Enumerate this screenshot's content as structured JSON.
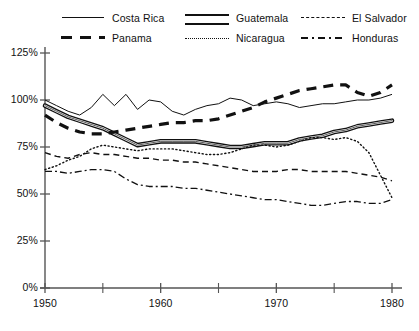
{
  "chart_data": {
    "type": "line",
    "title": "",
    "subtitle": "",
    "xlabel": "",
    "ylabel": "",
    "xlim": [
      1950,
      1980
    ],
    "ylim": [
      0,
      125
    ],
    "grid": false,
    "legend_position": "top",
    "y_ticks": [
      "0%",
      "25%",
      "50%",
      "75%",
      "100%",
      "125%"
    ],
    "y_tick_values": [
      0,
      25,
      50,
      75,
      100,
      125
    ],
    "x_ticks": [
      "1950",
      "1960",
      "1970",
      "1980"
    ],
    "x_tick_values": [
      1950,
      1960,
      1970,
      1980
    ],
    "x_minor_tick_values": [
      1955,
      1965,
      1975
    ],
    "x": [
      1950,
      1951,
      1952,
      1953,
      1954,
      1955,
      1956,
      1957,
      1958,
      1959,
      1960,
      1961,
      1962,
      1963,
      1964,
      1965,
      1966,
      1967,
      1968,
      1969,
      1970,
      1971,
      1972,
      1973,
      1974,
      1975,
      1976,
      1977,
      1978,
      1979,
      1980
    ],
    "series": [
      {
        "name": "Costa Rica",
        "style": "solid",
        "values": [
          100,
          97,
          94,
          92,
          96,
          103,
          97,
          103,
          95,
          100,
          99,
          94,
          92,
          95,
          97,
          98,
          101,
          100,
          97,
          98,
          99,
          98,
          96,
          97,
          98,
          98,
          99,
          100,
          100,
          101,
          103
        ]
      },
      {
        "name": "Guatemala",
        "style": "double",
        "values": [
          97,
          94,
          91,
          89,
          87,
          85,
          82,
          79,
          76,
          77,
          78,
          78,
          78,
          78,
          77,
          76,
          75,
          75,
          76,
          77,
          77,
          77,
          79,
          80,
          81,
          83,
          84,
          86,
          87,
          88,
          89
        ]
      },
      {
        "name": "El Salvador",
        "style": "dashed",
        "values": [
          72,
          70,
          69,
          71,
          72,
          71,
          71,
          70,
          69,
          69,
          68,
          68,
          67,
          67,
          66,
          65,
          64,
          63,
          62,
          62,
          62,
          63,
          63,
          62,
          62,
          62,
          62,
          61,
          60,
          59,
          57
        ]
      },
      {
        "name": "Panama",
        "style": "thickdash",
        "values": [
          92,
          88,
          85,
          83,
          82,
          82,
          83,
          84,
          85,
          86,
          87,
          88,
          88,
          89,
          89,
          90,
          92,
          94,
          96,
          99,
          101,
          103,
          105,
          106,
          107,
          108,
          108,
          104,
          102,
          104,
          108
        ]
      },
      {
        "name": "Nicaragua",
        "style": "dotted",
        "values": [
          63,
          65,
          68,
          70,
          74,
          76,
          75,
          74,
          73,
          74,
          74,
          74,
          73,
          72,
          71,
          71,
          72,
          74,
          76,
          76,
          75,
          76,
          78,
          80,
          80,
          79,
          80,
          78,
          72,
          60,
          48
        ]
      },
      {
        "name": "Honduras",
        "style": "dashdot",
        "values": [
          62,
          62,
          61,
          62,
          63,
          63,
          62,
          58,
          55,
          54,
          54,
          54,
          53,
          53,
          52,
          51,
          50,
          49,
          48,
          47,
          47,
          46,
          45,
          44,
          44,
          45,
          46,
          46,
          45,
          45,
          47
        ]
      }
    ]
  },
  "legend": {
    "rows": [
      [
        {
          "label": "Costa Rica",
          "swatch": "solid"
        },
        {
          "label": "Guatemala",
          "swatch": "double"
        },
        {
          "label": "El Salvador",
          "swatch": "dashed"
        }
      ],
      [
        {
          "label": "Panama",
          "swatch": "thickdash"
        },
        {
          "label": "Nicaragua",
          "swatch": "dotted"
        },
        {
          "label": "Honduras",
          "swatch": "dashdot"
        }
      ]
    ]
  },
  "colors": {
    "line": "#111111",
    "axis": "#555555",
    "background": "#ffffff"
  }
}
